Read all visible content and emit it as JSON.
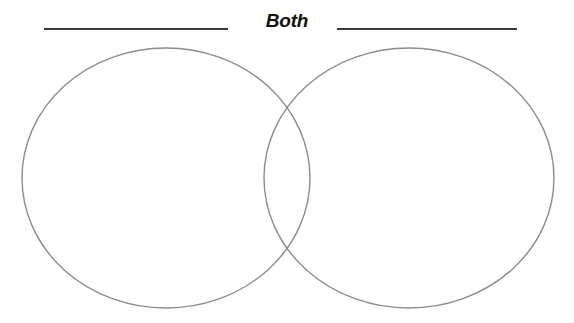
{
  "page": {
    "background_color": "#ffffff",
    "width": 574,
    "height": 323
  },
  "header": {
    "center_label": "Both",
    "left_blank_line": {
      "name": "left-category-write-in-line",
      "value": "",
      "placeholder": ""
    },
    "right_blank_line": {
      "name": "right-category-write-in-line",
      "value": "",
      "placeholder": ""
    },
    "line_color": "#3a3a3a",
    "label_color": "#111111"
  },
  "diagram": {
    "type": "venn",
    "set_count": 2,
    "stroke_color": "#8c8c8c",
    "stroke_width": 1.4,
    "fill": "none",
    "left_ellipse": {
      "label": "",
      "cx": 166,
      "cy": 178,
      "rx": 144,
      "ry": 130
    },
    "right_ellipse": {
      "label": "",
      "cx": 409,
      "cy": 178,
      "rx": 145,
      "ry": 130
    },
    "overlap_region_label": "Both",
    "contents": {
      "left_only": [],
      "overlap": [],
      "right_only": []
    }
  }
}
